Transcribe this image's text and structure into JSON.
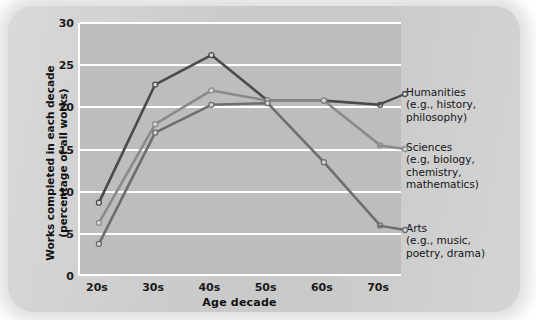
{
  "chart_data": {
    "type": "line",
    "title": "",
    "xlabel": "Age decade",
    "ylabel": "Works completed in each decade (percentage of all works)",
    "ylabel_line1": "Works completed in each decade",
    "ylabel_line2": "(percentage of all works)",
    "categories": [
      "20s",
      "30s",
      "40s",
      "50s",
      "60s",
      "70s"
    ],
    "ylim": [
      0,
      30
    ],
    "yticks": [
      0,
      5,
      10,
      15,
      20,
      25,
      30
    ],
    "grid": true,
    "legend_position": "right-inline",
    "series": [
      {
        "name": "Humanities",
        "sub": "(e.g., history, philosophy)",
        "color": "#4a4a4a",
        "values": [
          8.7,
          22.7,
          26.2,
          20.8,
          20.8,
          20.3
        ]
      },
      {
        "name": "Sciences",
        "sub": "(e.g, biology, chemistry, mathematics)",
        "color": "#8a8a8a",
        "values": [
          6.3,
          18.0,
          22.0,
          20.8,
          20.8,
          15.5
        ]
      },
      {
        "name": "Arts",
        "sub": "(e.g., music, poetry, drama)",
        "color": "#6e6e6e",
        "values": [
          3.8,
          17.0,
          20.3,
          20.5,
          13.5,
          6.0
        ]
      }
    ]
  },
  "legend": [
    {
      "name": "Humanities",
      "line2": "(e.g., history,",
      "line3": "philosophy)"
    },
    {
      "name": "Sciences",
      "line2": "(e.g, biology,",
      "line3": "chemistry,",
      "line4": "mathematics)"
    },
    {
      "name": "Arts",
      "line2": "(e.g., music,",
      "line3": "poetry, drama)"
    }
  ],
  "axis": {
    "x_title": "Age decade",
    "y_title_line1": "Works completed in each decade",
    "y_title_line2": "(percentage of all works)",
    "y_tick_labels": [
      "0",
      "5",
      "10",
      "15",
      "20",
      "25",
      "30"
    ],
    "x_tick_labels": [
      "20s",
      "30s",
      "40s",
      "50s",
      "60s",
      "70s"
    ]
  },
  "colors": {
    "paper": "#c9c9c9",
    "plot_background": "#bdbdbd",
    "gridline": "#ffffff",
    "humanities": "#4a4a4a",
    "sciences": "#8a8a8a",
    "arts": "#6e6e6e"
  }
}
